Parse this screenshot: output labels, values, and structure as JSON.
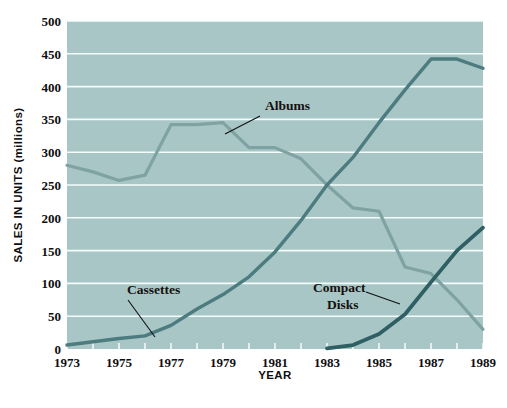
{
  "chart_data": {
    "type": "line",
    "title": "",
    "xlabel": "YEAR",
    "ylabel": "SALES IN UNITS (millions)",
    "xlim": [
      1973,
      1989
    ],
    "ylim": [
      0,
      500
    ],
    "grid": true,
    "legend": "inline-annotations",
    "x": [
      1973,
      1974,
      1975,
      1976,
      1977,
      1978,
      1979,
      1980,
      1981,
      1982,
      1983,
      1984,
      1985,
      1986,
      1987,
      1988,
      1989
    ],
    "xtick_labels": [
      "1973",
      "1975",
      "1977",
      "1979",
      "1981",
      "1983",
      "1985",
      "1987",
      "1989"
    ],
    "xtick_values": [
      1973,
      1975,
      1977,
      1979,
      1981,
      1983,
      1985,
      1987,
      1989
    ],
    "ytick_labels": [
      "0",
      "50",
      "100",
      "150",
      "200",
      "250",
      "300",
      "350",
      "400",
      "450",
      "500"
    ],
    "ytick_values": [
      0,
      50,
      100,
      150,
      200,
      250,
      300,
      350,
      400,
      450,
      500
    ],
    "series": [
      {
        "name": "Albums",
        "color": "#7FA3A3",
        "width": 3.2,
        "x": [
          1973,
          1974,
          1975,
          1976,
          1977,
          1978,
          1979,
          1980,
          1981,
          1982,
          1983,
          1984,
          1985,
          1986,
          1987,
          1988,
          1989
        ],
        "values": [
          280,
          270,
          257,
          265,
          342,
          342,
          345,
          307,
          307,
          290,
          250,
          215,
          210,
          125,
          115,
          75,
          30
        ]
      },
      {
        "name": "Cassettes",
        "color": "#4C7C80",
        "width": 3.4,
        "x": [
          1973,
          1974,
          1975,
          1976,
          1977,
          1978,
          1979,
          1980,
          1981,
          1982,
          1983,
          1984,
          1985,
          1986,
          1987,
          1988,
          1989
        ],
        "values": [
          6,
          11,
          16,
          20,
          36,
          61,
          83,
          110,
          148,
          196,
          250,
          292,
          345,
          395,
          442,
          442,
          428
        ]
      },
      {
        "name": "Compact Disks",
        "color": "#2E5F63",
        "width": 3.8,
        "x": [
          1983,
          1984,
          1985,
          1986,
          1987,
          1988,
          1989
        ],
        "values": [
          1,
          6,
          23,
          53,
          102,
          150,
          185
        ]
      }
    ],
    "annotations": [
      {
        "name": "albums-label",
        "text": "Albums",
        "x": 265,
        "y": 110,
        "leader": [
          [
            260,
            116
          ],
          [
            225,
            134
          ]
        ]
      },
      {
        "name": "cassettes-label",
        "text": "Cassettes",
        "x": 127,
        "y": 294,
        "leader": [
          [
            128,
            300
          ],
          [
            155,
            337
          ]
        ]
      },
      {
        "name": "compact-disks-label",
        "text": "Compact",
        "text2": "Disks",
        "x": 313,
        "y": 292,
        "leader": [
          [
            366,
            292
          ],
          [
            400,
            304
          ]
        ]
      }
    ]
  },
  "style": {
    "plot_background": "#a9c6c6",
    "page_background": "#ffffff",
    "gridline_color": "#f4fbfb",
    "text_color": "#0e0e10"
  }
}
